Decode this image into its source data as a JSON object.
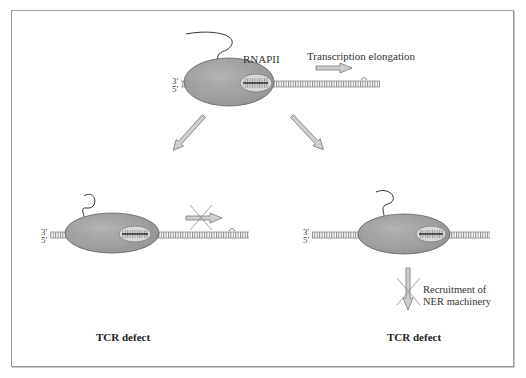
{
  "diagram": {
    "top": {
      "enzyme_label": "RNAPII",
      "process_label": "Transcription elongation",
      "strand_labels": [
        "3′",
        "5′"
      ]
    },
    "bottom_left": {
      "strand_labels": [
        "3′",
        "5′"
      ],
      "caption": "TCR defect",
      "blocked_process": "transcription elongation blocked"
    },
    "bottom_right": {
      "strand_labels": [
        "3′",
        "5′"
      ],
      "blocked_label_line1": "Recruitment of",
      "blocked_label_line2": "NER machinery",
      "caption": "TCR defect"
    },
    "colors": {
      "polymerase_fill": "#9c9c9c",
      "polymerase_edge": "#5a5a5a",
      "dna": "#8a8a8a",
      "arrow_fill": "#c8c8c8",
      "arrow_edge": "#7a7a7a",
      "cross": "#8c8c8c",
      "frame": "#9a9a9a"
    }
  }
}
